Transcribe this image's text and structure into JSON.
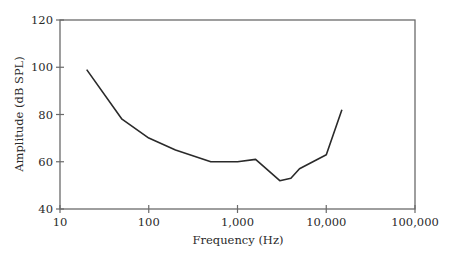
{
  "chart_data": {
    "type": "line",
    "title": "",
    "xlabel": "Frequency (Hz)",
    "ylabel": "Amplitude (dB SPL)",
    "xscale": "log",
    "xlim": [
      10,
      100000
    ],
    "ylim": [
      40,
      120
    ],
    "grid": false,
    "legend": null,
    "x_ticks": [
      10,
      100,
      1000,
      10000,
      100000
    ],
    "x_tick_labels": [
      "10",
      "100",
      "1,000",
      "10,000",
      "100,000"
    ],
    "y_ticks": [
      40,
      60,
      80,
      100,
      120
    ],
    "y_tick_labels": [
      "40",
      "60",
      "80",
      "100",
      "120"
    ],
    "series": [
      {
        "name": "Threshold curve",
        "color": "#2a2a2a",
        "x": [
          20,
          50,
          100,
          200,
          500,
          1000,
          1600,
          3000,
          4000,
          5000,
          10000,
          15000
        ],
        "y": [
          99,
          78,
          70,
          65,
          60,
          60,
          61,
          52,
          53,
          57,
          63,
          82
        ]
      }
    ]
  },
  "colors": {
    "axis": "#6a6a6a",
    "line": "#2a2a2a",
    "text": "#2a2a2a",
    "background": "#ffffff"
  }
}
